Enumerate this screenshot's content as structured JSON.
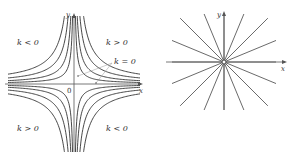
{
  "left_figure": {
    "axis_x_label": "x",
    "axis_y_label": "y",
    "origin_label": "0",
    "region_labels": {
      "top_left": "k < 0",
      "top_right": "k > 0",
      "bottom_left": "k > 0",
      "bottom_right": "k < 0"
    },
    "annotation": "k = 0",
    "curve_family": "xy = k",
    "k_values": [
      1,
      2.2,
      4,
      6.5
    ]
  },
  "right_figure": {
    "axis_x_label": "x",
    "axis_y_label": "y",
    "ray_count": 16,
    "origin_marker": "open-circle"
  },
  "colors": {
    "curve": "#333333",
    "axis": "#555555",
    "annotation_line": "#999999"
  }
}
